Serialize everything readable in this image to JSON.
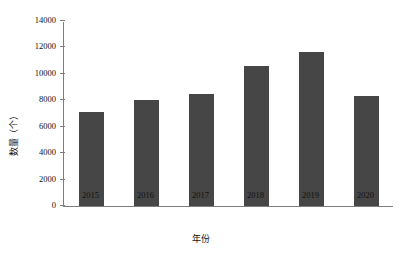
{
  "chart_data": {
    "type": "bar",
    "title": "",
    "xlabel": "年份",
    "ylabel": "数量（个）",
    "categories": [
      "2015",
      "2016",
      "2017",
      "2018",
      "2019",
      "2020"
    ],
    "values": [
      7150,
      8050,
      8450,
      10600,
      11650,
      8350
    ],
    "ylim": [
      0,
      14000
    ],
    "yticks": [
      0,
      2000,
      4000,
      6000,
      8000,
      10000,
      12000,
      14000
    ],
    "ytick_labels": [
      "0",
      "2000",
      "4000",
      "6000",
      "8000",
      "10000",
      "12000",
      "14000"
    ],
    "grid": false,
    "legend": null,
    "bar_color": "#464646",
    "axis_color": "#7d7d7d",
    "background": "#ffffff"
  }
}
